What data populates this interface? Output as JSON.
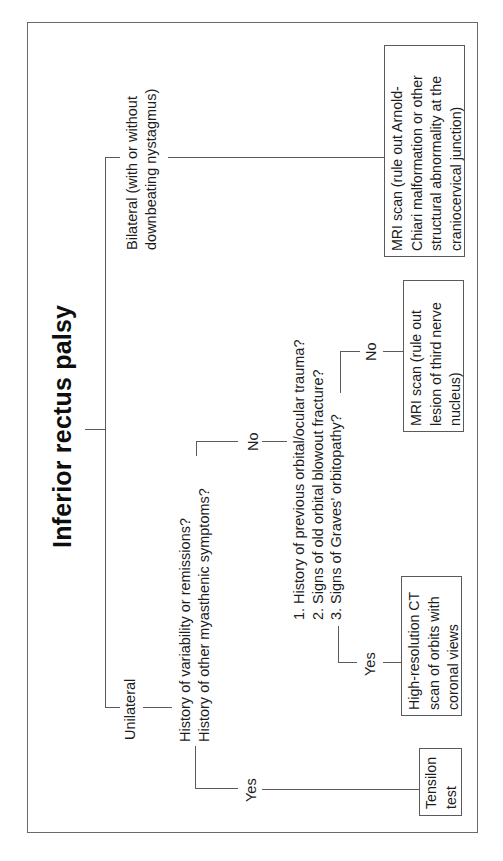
{
  "diagram": {
    "title": "Inferior rectus palsy",
    "orientation": "rotated -90 degrees (reads bottom-to-top)",
    "branches": {
      "bilateral": {
        "label_line1": "Bilateral (with or without",
        "label_line2": "downbeating nystagmus)",
        "outcome": {
          "line1": "MRI scan (rule out Arnold-",
          "line2": "Chiari malformation or other",
          "line3": "structural abnormality at the",
          "line4": "craniocervical junction)"
        }
      },
      "unilateral": {
        "label": "Unilateral",
        "question": {
          "line1": "History of variability or remissions?",
          "line2": "History of other myasthenic symptoms?"
        },
        "yes": {
          "label": "Yes",
          "outcome": {
            "line1": "Tensilon",
            "line2": "test"
          }
        },
        "no": {
          "label": "No",
          "questions": [
            "1. History of previous orbital/ocular trauma?",
            "2. Signs of old orbital blowout fracture?",
            "3. Signs of Graves’ orbitopathy?"
          ],
          "yes": {
            "label": "Yes",
            "outcome": {
              "line1": "High-resolution CT",
              "line2": "scan of orbits with",
              "line3": "coronal views"
            }
          },
          "no": {
            "label": "No",
            "outcome": {
              "line1": "MRI scan (rule out",
              "line2": "lesion of third nerve",
              "line3": "nucleus)"
            }
          }
        }
      }
    },
    "colors": {
      "line": "#5a5a5a",
      "frame": "#6a6a6a",
      "text": "#1c1c1c",
      "background": "#ffffff"
    }
  }
}
